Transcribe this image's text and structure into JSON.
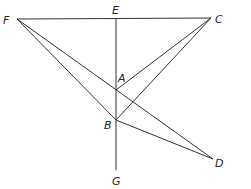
{
  "diagram": {
    "type": "geometry-figure",
    "points": {
      "F": {
        "label": "F",
        "x": 17,
        "y": 19
      },
      "E": {
        "label": "E",
        "x": 116,
        "y": 19
      },
      "C": {
        "label": "C",
        "x": 211,
        "y": 18
      },
      "A": {
        "label": "A",
        "x": 116,
        "y": 90
      },
      "B": {
        "label": "B",
        "x": 116,
        "y": 120
      },
      "D": {
        "label": "D",
        "x": 213,
        "y": 159
      },
      "G": {
        "label": "G",
        "x": 116,
        "y": 170
      }
    },
    "segments": [
      [
        "F",
        "C"
      ],
      [
        "E",
        "G"
      ],
      [
        "F",
        "D"
      ],
      [
        "F",
        "B"
      ],
      [
        "B",
        "D"
      ],
      [
        "C",
        "A"
      ],
      [
        "C",
        "B"
      ]
    ],
    "stroke_color": "#333333"
  }
}
